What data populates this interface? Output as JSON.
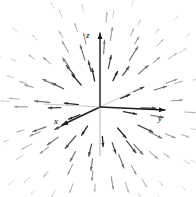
{
  "figure": {
    "background_color": "#ffffff",
    "width": 196,
    "height": 197
  },
  "axes": {
    "origin": {
      "x": 100,
      "y": 107
    },
    "items": [
      {
        "name": "z",
        "label": "z",
        "label_x": 86,
        "label_y": 31,
        "tip_x": 100,
        "tip_y": 33,
        "tail_x": 100,
        "tail_y": 107,
        "extension_x": 100,
        "extension_y": 156,
        "color": "#1a1a1a",
        "extension_color": "#b5b5b5"
      },
      {
        "name": "x",
        "label": "x",
        "label_x": 54,
        "label_y": 117,
        "tip_x": 62,
        "tip_y": 125,
        "tail_x": 100,
        "tail_y": 107,
        "extension_x": 140,
        "extension_y": 88,
        "color": "#1a1a1a",
        "extension_color": "#c8c8c8"
      },
      {
        "name": "y",
        "label": "y",
        "label_x": 158,
        "label_y": 114,
        "tip_x": 165,
        "tip_y": 110,
        "tail_x": 100,
        "tail_y": 107,
        "extension_x": 44,
        "extension_y": 104,
        "color": "#1a1a1a",
        "extension_color": "#c8c8c8"
      }
    ]
  },
  "chart_data": {
    "type": "quiver",
    "title": "",
    "xlabel": "x",
    "ylabel": "y",
    "zlabel": "z",
    "origin": {
      "x": 100,
      "y": 107
    },
    "arrow_color_near": "#1a1a1a",
    "arrow_color_far": "#d8d8d8",
    "rings": [
      {
        "radius": 26,
        "count": 10,
        "length": 13,
        "angle_offset": 0.18,
        "gray": 40,
        "width": 1.3
      },
      {
        "radius": 40,
        "count": 14,
        "length": 14,
        "angle_offset": 0.42,
        "gray": 70,
        "width": 1.2
      },
      {
        "radius": 54,
        "count": 16,
        "length": 13,
        "angle_offset": 0.1,
        "gray": 110,
        "width": 1.1
      },
      {
        "radius": 68,
        "count": 18,
        "length": 11,
        "angle_offset": 0.33,
        "gray": 145,
        "width": 1.0
      },
      {
        "radius": 82,
        "count": 20,
        "length": 9,
        "angle_offset": 0.07,
        "gray": 175,
        "width": 1.0
      },
      {
        "radius": 96,
        "count": 22,
        "length": 7,
        "angle_offset": 0.28,
        "gray": 200,
        "width": 0.9
      },
      {
        "radius": 110,
        "count": 22,
        "length": 6,
        "angle_offset": 0.5,
        "gray": 216,
        "width": 0.9
      }
    ],
    "jitter_seed": 7,
    "jitter_radial": 5,
    "jitter_angular": 0.075
  }
}
